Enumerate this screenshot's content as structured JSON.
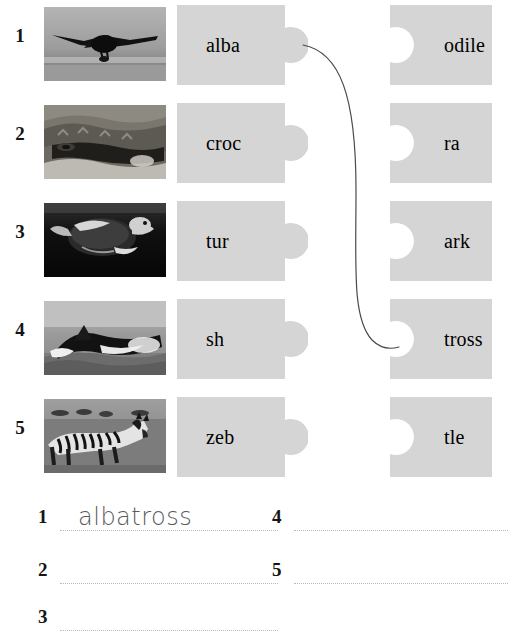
{
  "worksheet": {
    "title": "Animal Word Match Puzzle Worksheet",
    "piece_color": "#d5d5d5",
    "text_color": "#000000",
    "number_color": "#151515",
    "line_color": "#b9b9b9",
    "connector_color": "#4a4a4a",
    "handwriting_color": "#5a5a5a"
  },
  "rows": [
    {
      "number": "1",
      "image_name": "albatross-photo",
      "image_alt": "Black albatross bird gliding low over grey ocean water",
      "left_piece": "alba",
      "right_piece": "odile"
    },
    {
      "number": "2",
      "image_name": "crocodile-photo",
      "image_alt": "Close-up of a crocodile head at the water surface",
      "left_piece": "croc",
      "right_piece": "ra"
    },
    {
      "number": "3",
      "image_name": "turtle-photo",
      "image_alt": "Sea turtle swimming underwater in dark water",
      "left_piece": "tur",
      "right_piece": "ark"
    },
    {
      "number": "4",
      "image_name": "shark-photo",
      "image_alt": "Shark breaching through the surface of the sea",
      "left_piece": "sh",
      "right_piece": "tross"
    },
    {
      "number": "5",
      "image_name": "zebra-photo",
      "image_alt": "Zebra standing in open grassland savannah",
      "left_piece": "zeb",
      "right_piece": "tle"
    }
  ],
  "connector": {
    "from_piece": "alba",
    "to_piece": "tross",
    "from_row": 1,
    "to_row": 4
  },
  "answers": [
    {
      "number": "1",
      "value": "albatross"
    },
    {
      "number": "2",
      "value": ""
    },
    {
      "number": "3",
      "value": ""
    },
    {
      "number": "4",
      "value": ""
    },
    {
      "number": "5",
      "value": ""
    }
  ]
}
